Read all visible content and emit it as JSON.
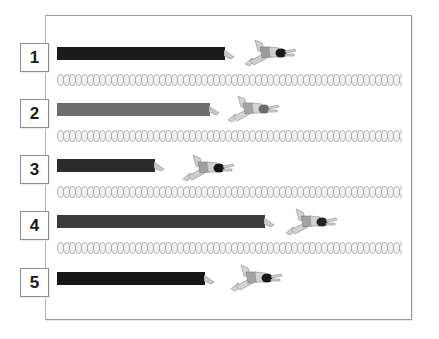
{
  "figure": {
    "background_color": "#ffffff",
    "frame": {
      "border_color": "#9a9a9a",
      "x": 45,
      "y": 15,
      "width": 367,
      "height": 305
    },
    "rail_color": "#b3b3b3"
  },
  "lanes": [
    {
      "number": "1",
      "box_top": 43,
      "bar": {
        "top": 47,
        "length": 168,
        "color": "#1c1c1c",
        "tip_color": "#c9c9c9"
      },
      "swimmer": {
        "left": 243,
        "top": 37,
        "cap_color": "#171717",
        "body_color": "#cfcfcf",
        "suit_color": "#9c9c9c"
      }
    },
    {
      "number": "2",
      "box_top": 99,
      "bar": {
        "top": 103,
        "length": 153,
        "color": "#6d6d6d",
        "tip_color": "#c9c9c9"
      },
      "swimmer": {
        "left": 226,
        "top": 93,
        "cap_color": "#6b6b6b",
        "body_color": "#d4d4d4",
        "suit_color": "#a5a5a5"
      }
    },
    {
      "number": "3",
      "box_top": 155,
      "bar": {
        "top": 159,
        "length": 98,
        "color": "#2b2b2b",
        "tip_color": "#c9c9c9"
      },
      "swimmer": {
        "left": 181,
        "top": 152,
        "cap_color": "#141414",
        "body_color": "#d0d0d0",
        "suit_color": "#9f9f9f"
      }
    },
    {
      "number": "4",
      "box_top": 211,
      "bar": {
        "top": 215,
        "length": 208,
        "color": "#3b3b3b",
        "tip_color": "#c9c9c9"
      },
      "swimmer": {
        "left": 284,
        "top": 206,
        "cap_color": "#232323",
        "body_color": "#d2d2d2",
        "suit_color": "#a1a1a1"
      }
    },
    {
      "number": "5",
      "box_top": 268,
      "bar": {
        "top": 272,
        "length": 148,
        "color": "#161616",
        "tip_color": "#c9c9c9"
      },
      "swimmer": {
        "left": 229,
        "top": 262,
        "cap_color": "#1a1a1a",
        "body_color": "#d3d3d3",
        "suit_color": "#a3a3a3"
      }
    }
  ],
  "lane_ropes": [
    {
      "top": 74,
      "left": 57,
      "width": 345,
      "float_color": "#f3f3f3",
      "outline_color": "#a9a9a9"
    },
    {
      "top": 130,
      "left": 57,
      "width": 345,
      "float_color": "#f3f3f3",
      "outline_color": "#a9a9a9"
    },
    {
      "top": 186,
      "left": 57,
      "width": 345,
      "float_color": "#f3f3f3",
      "outline_color": "#a9a9a9"
    },
    {
      "top": 242,
      "left": 57,
      "width": 345,
      "float_color": "#f3f3f3",
      "outline_color": "#a9a9a9"
    }
  ],
  "chart_data": {
    "type": "bar",
    "orientation": "horizontal",
    "categories": [
      "1",
      "2",
      "3",
      "4",
      "5"
    ],
    "values": [
      168,
      153,
      98,
      208,
      148
    ],
    "value_unit": "px",
    "colors": [
      "#1c1c1c",
      "#6d6d6d",
      "#2b2b2b",
      "#3b3b3b",
      "#161616"
    ],
    "xlabel": "",
    "ylabel": "Lane",
    "grid": false,
    "legend": "none",
    "annotations": [
      "Each bar terminates in a pointer followed by a swimmer figure"
    ]
  }
}
